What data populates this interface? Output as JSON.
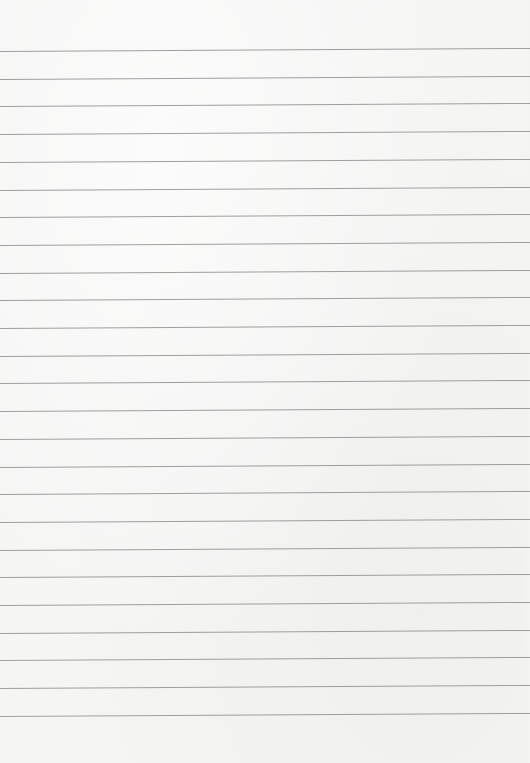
{
  "paper": {
    "background_color": "#f5f5f4",
    "line_color": "#8f8f8f",
    "line_count": 25,
    "first_line_y": 51,
    "line_spacing": 27.7,
    "tilt_deg": -0.33
  }
}
